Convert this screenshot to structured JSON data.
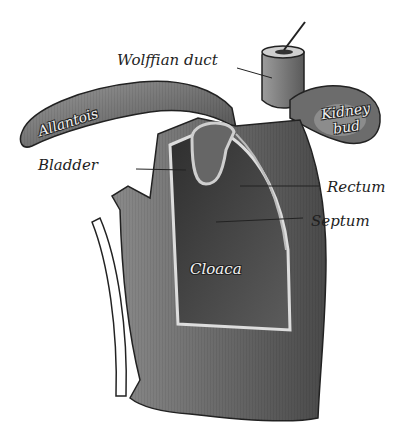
{
  "figure": {
    "labels": {
      "wolffian_duct": "Wolffian duct",
      "kidney_bud_line1": "Kidney",
      "kidney_bud_line2": "bud",
      "allantois": "Allantois",
      "bladder": "Bladder",
      "rectum": "Rectum",
      "septum": "Septum",
      "cloaca": "Cloaca"
    },
    "colors": {
      "background": "#ffffff",
      "tissue_dark": "#3a3a3a",
      "tissue_mid": "#7a7a7a",
      "tissue_light": "#b5b5b5",
      "ink": "#1e1e1e"
    }
  }
}
